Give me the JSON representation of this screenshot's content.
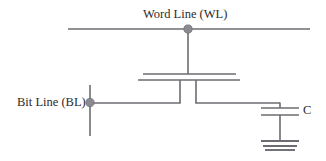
{
  "diagram": {
    "title_text": "Word Line (WL)",
    "kind": "DRAM one-transistor one-capacitor memory cell schematic",
    "labels": {
      "word_line": "Word Line (WL)",
      "bit_line": "Bit Line (BL)",
      "capacitor": "C"
    },
    "colors": {
      "background": "#ffffff",
      "wire": "#6b6b72",
      "junction_dot": "#8a8a90",
      "text": "#2b2b2b"
    },
    "nodes": [
      {
        "name": "word-line-junction",
        "x": 188,
        "y": 29
      },
      {
        "name": "bit-line-junction",
        "x": 90,
        "y": 102
      }
    ],
    "components": [
      {
        "name": "word-line-rail",
        "type": "wire",
        "x1": 68,
        "y1": 29,
        "x2": 310,
        "y2": 29
      },
      {
        "name": "gate-stem",
        "type": "wire",
        "x1": 188,
        "y1": 29,
        "x2": 188,
        "y2": 74
      },
      {
        "name": "transistor-gate-plate",
        "type": "plate",
        "x1": 143,
        "y1": 74,
        "x2": 236,
        "y2": 74
      },
      {
        "name": "transistor-channel-plate",
        "type": "plate",
        "x1": 138,
        "y1": 80,
        "x2": 240,
        "y2": 80
      },
      {
        "name": "source-leg",
        "type": "wire",
        "x1": 180,
        "y1": 80,
        "x2": 180,
        "y2": 103
      },
      {
        "name": "drain-leg",
        "type": "wire",
        "x1": 196,
        "y1": 80,
        "x2": 196,
        "y2": 103
      },
      {
        "name": "bit-line-vertical",
        "type": "wire",
        "x1": 90,
        "y1": 85,
        "x2": 90,
        "y2": 136
      },
      {
        "name": "bit-line-horizontal",
        "type": "wire",
        "x1": 90,
        "y1": 103,
        "x2": 180,
        "y2": 103
      },
      {
        "name": "storage-node-wire",
        "type": "wire",
        "x1": 196,
        "y1": 103,
        "x2": 280,
        "y2": 103
      },
      {
        "name": "capacitor-drop-wire",
        "type": "wire",
        "x1": 280,
        "y1": 103,
        "x2": 280,
        "y2": 108
      },
      {
        "name": "capacitor-top-plate",
        "type": "plate",
        "x1": 261,
        "y1": 108,
        "x2": 299,
        "y2": 108
      },
      {
        "name": "capacitor-bottom-plate",
        "type": "plate",
        "x1": 261,
        "y1": 115,
        "x2": 299,
        "y2": 115
      },
      {
        "name": "capacitor-ground-stem",
        "type": "wire",
        "x1": 280,
        "y1": 115,
        "x2": 280,
        "y2": 141
      },
      {
        "name": "ground-bar-1",
        "type": "gnd",
        "x1": 261,
        "y1": 141,
        "x2": 299,
        "y2": 141
      },
      {
        "name": "ground-bar-2",
        "type": "gnd",
        "x1": 263,
        "y1": 146,
        "x2": 297,
        "y2": 146
      },
      {
        "name": "ground-bar-3",
        "type": "gnd",
        "x1": 265,
        "y1": 150,
        "x2": 295,
        "y2": 150
      }
    ]
  }
}
